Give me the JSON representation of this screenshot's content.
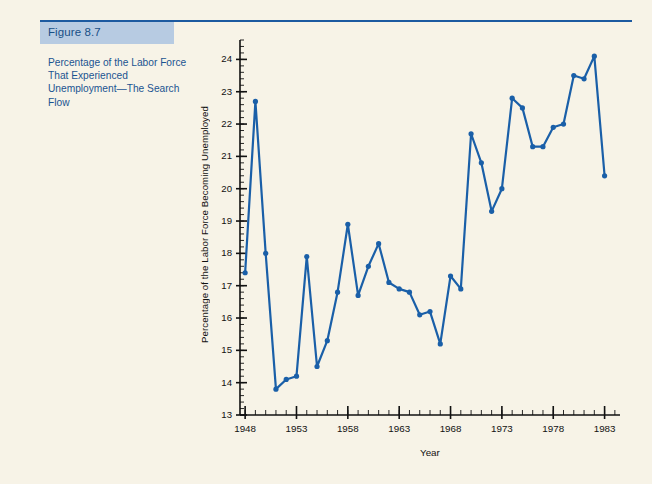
{
  "figure": {
    "label": "Figure 8.7",
    "caption": "Percentage of the Labor Force That Experienced Unemployment—The Search Flow",
    "band_color": "#b7cbe2",
    "rule_color": "#1c5aa0",
    "text_color": "#1b5391",
    "page_bg": "#f7f3e7"
  },
  "chart_data": {
    "type": "line",
    "title": "",
    "subtitle": "",
    "xlabel": "Year",
    "ylabel": "Percentage of the Labor Force Becoming Unemployed",
    "xlim": [
      1947.5,
      1984.5
    ],
    "ylim": [
      13,
      24.6
    ],
    "grid": false,
    "legend": null,
    "series_color": "#1a5fa8",
    "marker": "circle",
    "y_major_ticks": [
      13,
      14,
      15,
      16,
      17,
      18,
      19,
      20,
      21,
      22,
      23,
      24
    ],
    "y_minor_tick_step": 0.2,
    "x_major_ticks": [
      1948,
      1953,
      1958,
      1963,
      1968,
      1973,
      1978,
      1983
    ],
    "x_minor_tick_step": 1,
    "x_tick_labels": [
      "1948",
      "1953",
      "1958",
      "1963",
      "1968",
      "1973",
      "1978",
      "1983"
    ],
    "y_tick_labels": [
      "13",
      "14",
      "15",
      "16",
      "17",
      "18",
      "19",
      "20",
      "21",
      "22",
      "23",
      "24"
    ],
    "x": [
      1948,
      1949,
      1950,
      1951,
      1952,
      1953,
      1954,
      1955,
      1956,
      1957,
      1958,
      1959,
      1960,
      1961,
      1962,
      1963,
      1964,
      1965,
      1966,
      1967,
      1968,
      1969,
      1970,
      1971,
      1972,
      1973,
      1974,
      1975,
      1976,
      1977,
      1978,
      1979,
      1980,
      1981,
      1982,
      1983
    ],
    "values": [
      17.4,
      22.7,
      18.0,
      13.8,
      14.1,
      14.2,
      17.9,
      14.5,
      15.3,
      16.8,
      18.9,
      16.7,
      17.6,
      18.3,
      17.1,
      16.9,
      16.8,
      16.1,
      16.2,
      15.2,
      17.3,
      16.9,
      21.7,
      20.8,
      19.3,
      20.0,
      22.8,
      22.5,
      21.3,
      21.3,
      21.9,
      22.0,
      23.5,
      23.4,
      24.1,
      20.4
    ],
    "series": [
      {
        "name": "Percentage of the Labor Force Becoming Unemployed",
        "values": [
          17.4,
          22.7,
          18.0,
          13.8,
          14.1,
          14.2,
          17.9,
          14.5,
          15.3,
          16.8,
          18.9,
          16.7,
          17.6,
          18.3,
          17.1,
          16.9,
          16.8,
          16.1,
          16.2,
          15.2,
          17.3,
          16.9,
          21.7,
          20.8,
          19.3,
          20.0,
          22.8,
          22.5,
          21.3,
          21.3,
          21.9,
          22.0,
          23.5,
          23.4,
          24.1,
          20.4
        ]
      }
    ]
  }
}
